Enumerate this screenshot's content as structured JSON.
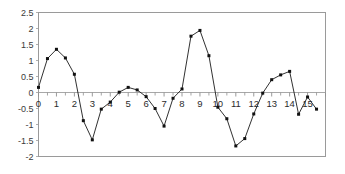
{
  "chart_data": {
    "type": "line",
    "title": "",
    "xlabel": "",
    "ylabel": "",
    "xlim": [
      0,
      16
    ],
    "ylim": [
      -2,
      2.5
    ],
    "grid": false,
    "legend": false,
    "marker": "square",
    "line_color": "#1a1a1a",
    "frame_color": "#9a9a9a",
    "y_ticks": [
      2.5,
      2,
      1.5,
      1,
      0.5,
      0,
      -0.5,
      -1,
      -1.5,
      -2
    ],
    "y_tick_labels": [
      "2.5",
      "2",
      "1.5",
      "1",
      "0.5",
      "0",
      "-0.5",
      "-1",
      "-1.5",
      "-2"
    ],
    "x_ticks": [
      0,
      1,
      2,
      3,
      4,
      5,
      6,
      7,
      8,
      9,
      10,
      11,
      12,
      13,
      14,
      15
    ],
    "x_tick_labels": [
      "0",
      "1",
      "2",
      "3",
      "4",
      "5",
      "6",
      "7",
      "8",
      "9",
      "10",
      "11",
      "12",
      "13",
      "14",
      "15"
    ],
    "x_minor_step": 0.5,
    "x": [
      0,
      0.5,
      1,
      1.5,
      2,
      2.5,
      3,
      3.5,
      4,
      4.5,
      5,
      5.5,
      6,
      6.5,
      7,
      7.5,
      8,
      8.5,
      9,
      9.5,
      10,
      10.5,
      11,
      11.5,
      12,
      12.5,
      13,
      13.5,
      14,
      14.5,
      15,
      15.5
    ],
    "values": [
      0.16,
      1.06,
      1.35,
      1.08,
      0.57,
      -0.88,
      -1.48,
      -0.52,
      -0.3,
      0.01,
      0.16,
      0.08,
      -0.13,
      -0.5,
      -1.05,
      -0.18,
      0.11,
      1.76,
      1.94,
      1.15,
      -0.46,
      -0.82,
      -1.67,
      -1.44,
      -0.67,
      -0.02,
      0.4,
      0.55,
      0.66,
      -0.68,
      -0.14,
      -0.52
    ]
  }
}
